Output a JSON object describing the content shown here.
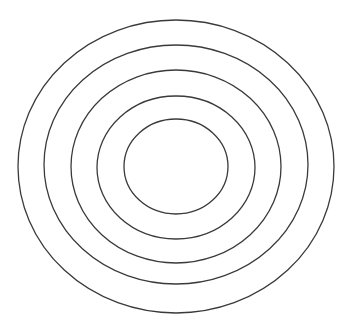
{
  "diagram": {
    "type": "concentric-ellipses",
    "background": "#ffffff",
    "stroke_color": "#3a3a3a",
    "stroke_width": 1.3,
    "ellipses": [
      {
        "cx": 176,
        "cy": 166.5,
        "rx": 158,
        "ry": 146.5
      },
      {
        "cx": 176,
        "cy": 164.5,
        "rx": 132,
        "ry": 119.5
      },
      {
        "cx": 176,
        "cy": 166.5,
        "rx": 105,
        "ry": 96.5
      },
      {
        "cx": 176,
        "cy": 167.5,
        "rx": 79,
        "ry": 71.5
      },
      {
        "cx": 176,
        "cy": 166.5,
        "rx": 52,
        "ry": 47.5
      }
    ]
  }
}
